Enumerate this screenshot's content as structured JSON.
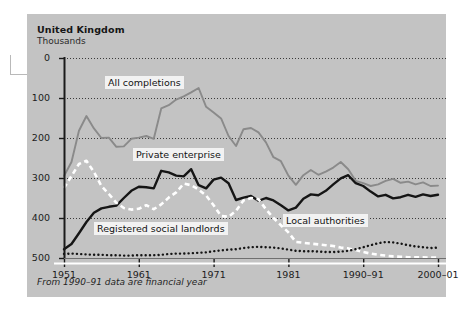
{
  "figure": {
    "title": "United Kingdom",
    "subtitle": "Thousands",
    "footnote": "From 1990–91 data are financial year",
    "panel_color": "#c3c3c3",
    "page_color": "#ffffff"
  },
  "labels": {
    "all_completions": "All completions",
    "private_enterprise": "Private enterprise",
    "registered_social_landlords": "Registered social landlords",
    "local_authorities": "Local authorities"
  },
  "axis": {
    "y_ticks": [
      "500",
      "400",
      "300",
      "200",
      "100",
      "0"
    ],
    "x_ticks": [
      "1951",
      "1961",
      "1971",
      "1981",
      "1990–91",
      "2000–01"
    ]
  },
  "chart_data": {
    "type": "line",
    "title": "United Kingdom",
    "subtitle": "Thousands",
    "xlabel": "",
    "ylabel": "Thousands",
    "ylim": [
      0,
      500
    ],
    "xlim": [
      1951,
      2001
    ],
    "grid": true,
    "legend_position": "inline-callout",
    "annotations": [
      "From 1990–91 data are financial year"
    ],
    "y_ticks": [
      0,
      100,
      200,
      300,
      400,
      500
    ],
    "x_tick_values": [
      1951,
      1961,
      1971,
      1981,
      1991,
      2001
    ],
    "x_tick_labels": [
      "1951",
      "1961",
      "1971",
      "1981",
      "1990–91",
      "2000–01"
    ],
    "x": [
      1951,
      1952,
      1953,
      1954,
      1955,
      1956,
      1957,
      1958,
      1959,
      1960,
      1961,
      1962,
      1963,
      1964,
      1965,
      1966,
      1967,
      1968,
      1969,
      1970,
      1971,
      1972,
      1973,
      1974,
      1975,
      1976,
      1977,
      1978,
      1979,
      1980,
      1981,
      1982,
      1983,
      1984,
      1985,
      1986,
      1987,
      1988,
      1989,
      1990,
      1991,
      1992,
      1993,
      1994,
      1995,
      1996,
      1997,
      1998,
      1999,
      2000,
      2001
    ],
    "series": [
      {
        "name": "All completions",
        "color": "#8a8a8a",
        "style": "solid",
        "values": [
          205,
          240,
          318,
          355,
          324,
          300,
          301,
          278,
          279,
          298,
          301,
          305,
          298,
          374,
          382,
          396,
          404,
          414,
          425,
          378,
          364,
          349,
          305,
          280,
          322,
          325,
          314,
          289,
          252,
          242,
          206,
          183,
          207,
          220,
          208,
          216,
          226,
          240,
          222,
          193,
          187,
          180,
          184,
          193,
          198,
          188,
          191,
          184,
          189,
          180,
          181
        ]
      },
      {
        "name": "Private enterprise",
        "color": "#151515",
        "style": "solid",
        "values": [
          22,
          35,
          62,
          90,
          113,
          124,
          128,
          131,
          150,
          168,
          178,
          177,
          174,
          218,
          214,
          206,
          204,
          222,
          182,
          174,
          196,
          201,
          187,
          145,
          151,
          155,
          143,
          150,
          144,
          132,
          119,
          126,
          148,
          159,
          157,
          168,
          184,
          199,
          207,
          187,
          180,
          166,
          154,
          158,
          149,
          152,
          158,
          153,
          159,
          155,
          158
        ]
      },
      {
        "name": "Local authorities",
        "color": "#ffffff",
        "style": "dashed",
        "values": [
          175,
          205,
          235,
          243,
          215,
          180,
          160,
          138,
          125,
          121,
          123,
          132,
          122,
          134,
          151,
          164,
          186,
          182,
          171,
          156,
          132,
          105,
          103,
          118,
          144,
          150,
          147,
          122,
          100,
          82,
          64,
          40,
          38,
          36,
          34,
          32,
          30,
          26,
          24,
          20,
          15,
          11,
          8,
          6,
          4,
          3,
          2,
          2,
          2,
          1,
          1
        ]
      },
      {
        "name": "Registered social landlords",
        "color": "#151515",
        "style": "dotted",
        "values": [
          10,
          11,
          10,
          9,
          8,
          8,
          7,
          7,
          6,
          6,
          7,
          7,
          7,
          8,
          10,
          11,
          11,
          12,
          13,
          14,
          17,
          19,
          21,
          22,
          25,
          27,
          28,
          27,
          26,
          24,
          21,
          18,
          17,
          17,
          16,
          15,
          15,
          16,
          18,
          22,
          27,
          32,
          37,
          40,
          39,
          36,
          32,
          29,
          27,
          25,
          26
        ]
      }
    ]
  },
  "geometry": {
    "plot_left": 64,
    "plot_right": 438,
    "plot_top": 58,
    "plot_bottom": 258,
    "y_min": 0,
    "y_max": 500
  }
}
